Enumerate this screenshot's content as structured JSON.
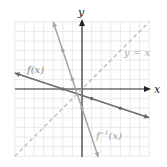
{
  "chart_data": {
    "type": "line",
    "title": "",
    "xlabel": "x",
    "ylabel": "y",
    "xlim": [
      -7,
      7
    ],
    "ylim": [
      -7,
      7
    ],
    "grid": true,
    "legend_position": "inline labels",
    "series": [
      {
        "name": "f(x)",
        "label": "f(x)",
        "equation": "y = -x/3 - 2/3",
        "style": "solid",
        "color": "#6b6b6b",
        "points": [
          [
            -2,
            0
          ],
          [
            1,
            -1
          ],
          [
            4,
            -2
          ]
        ],
        "range_x": [
          -7,
          7
        ]
      },
      {
        "name": "f^-1(x)",
        "label": "f",
        "label_sup": "−1",
        "label_tail": "(x)",
        "equation": "y = -3x - 2",
        "style": "solid",
        "color": "#a6a6a6",
        "points": [
          [
            -2,
            4
          ],
          [
            -1,
            1
          ],
          [
            0,
            -2
          ]
        ],
        "range_x": [
          -3,
          1.7
        ]
      },
      {
        "name": "y = x",
        "label": "y = x",
        "equation": "y = x",
        "style": "dashed",
        "color": "#b8b8b8",
        "range_x": [
          -7,
          7
        ]
      }
    ]
  },
  "labels": {
    "x_axis": "x",
    "y_axis": "y",
    "f": "f(x)",
    "finv_base": "f",
    "finv_sup": "−1",
    "finv_tail": "(x)",
    "identity": "y = x"
  }
}
